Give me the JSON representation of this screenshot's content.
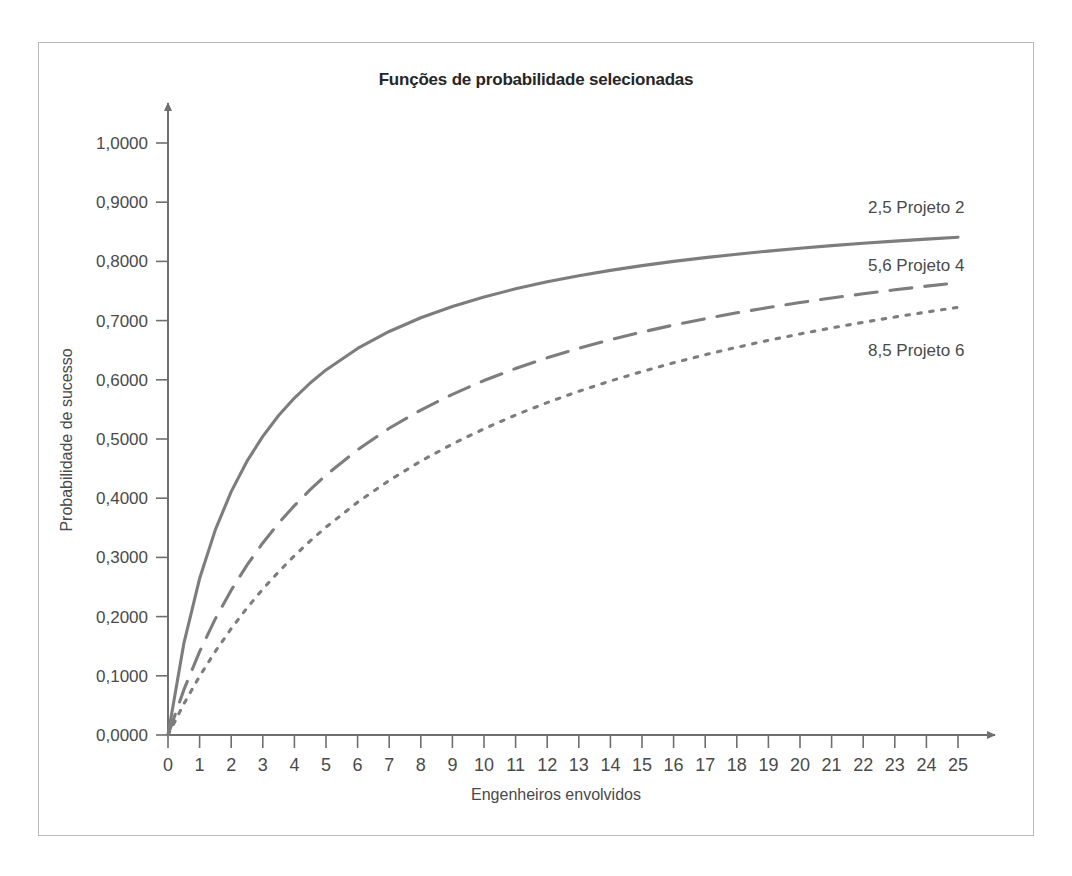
{
  "figure": {
    "title": "Funções de probabilidade selecionadas",
    "frame_color": "#b9b9b9",
    "background": "#ffffff"
  },
  "chart_data": {
    "type": "line",
    "title": "Funções de probabilidade selecionadas",
    "xlabel": "Engenheiros envolvidos",
    "ylabel": "Probabilidade de sucesso",
    "xlim": [
      0,
      25
    ],
    "ylim": [
      0,
      1.0
    ],
    "grid": false,
    "legend_position": "right-inline",
    "x_ticks": [
      0,
      1,
      2,
      3,
      4,
      5,
      6,
      7,
      8,
      9,
      10,
      11,
      12,
      13,
      14,
      15,
      16,
      17,
      18,
      19,
      20,
      21,
      22,
      23,
      24,
      25
    ],
    "x_tick_labels": [
      "0",
      "1",
      "2",
      "3",
      "4",
      "5",
      "6",
      "7",
      "8",
      "9",
      "10",
      "11",
      "12",
      "13",
      "14",
      "15",
      "16",
      "17",
      "18",
      "19",
      "20",
      "21",
      "22",
      "23",
      "24",
      "25"
    ],
    "y_ticks": [
      0.0,
      0.1,
      0.2,
      0.3,
      0.4,
      0.5,
      0.6,
      0.7,
      0.8,
      0.9,
      1.0
    ],
    "y_tick_labels": [
      "0,0000",
      "0,1000",
      "0,2000",
      "0,3000",
      "0,4000",
      "0,5000",
      "0,6000",
      "0,7000",
      "0,8000",
      "0,9000",
      "1,0000"
    ],
    "x": [
      0,
      0.5,
      1,
      1.5,
      2,
      2.5,
      3,
      3.5,
      4,
      4.5,
      5,
      6,
      7,
      8,
      9,
      10,
      11,
      12,
      13,
      14,
      15,
      16,
      17,
      18,
      19,
      20,
      21,
      22,
      23,
      24,
      25
    ],
    "series": [
      {
        "name": "2,5 Projeto 2",
        "legend_label": "2,5 Projeto 2",
        "param_k": 2.5,
        "asymptote": 0.925,
        "style": "solid",
        "color": "#7d7d7d",
        "values": [
          0.0,
          0.1542,
          0.2643,
          0.3469,
          0.4111,
          0.4625,
          0.5045,
          0.5396,
          0.5692,
          0.5946,
          0.6167,
          0.6529,
          0.6816,
          0.7048,
          0.7239,
          0.74,
          0.7537,
          0.7655,
          0.7758,
          0.7848,
          0.7929,
          0.8,
          0.8064,
          0.8122,
          0.8174,
          0.8222,
          0.8266,
          0.8306,
          0.8343,
          0.8377,
          0.8409
        ]
      },
      {
        "name": "5,6 Projeto 4",
        "legend_label": "5,6 Projeto 4",
        "param_k": 5.6,
        "asymptote": 0.93,
        "style": "dashed",
        "color": "#7d7d7d",
        "values": [
          0.0,
          0.0762,
          0.1409,
          0.1965,
          0.2447,
          0.287,
          0.3244,
          0.3577,
          0.3875,
          0.4144,
          0.4389,
          0.4819,
          0.5181,
          0.5489,
          0.5755,
          0.5987,
          0.6191,
          0.6371,
          0.6532,
          0.6677,
          0.6807,
          0.6925,
          0.7032,
          0.7131,
          0.7221,
          0.7305,
          0.7382,
          0.7453,
          0.752,
          0.7582,
          0.764
        ]
      },
      {
        "name": "8,5 Projeto 6",
        "legend_label": "8,5 Projeto 6",
        "param_k": 8.5,
        "asymptote": 0.944,
        "style": "dotted",
        "color": "#7d7d7d",
        "values": [
          0.0,
          0.0525,
          0.0993,
          0.1414,
          0.1797,
          0.2145,
          0.2464,
          0.2757,
          0.3027,
          0.3278,
          0.3511,
          0.3932,
          0.4301,
          0.4626,
          0.4915,
          0.5173,
          0.5405,
          0.5615,
          0.5806,
          0.598,
          0.614,
          0.6287,
          0.6423,
          0.6549,
          0.6666,
          0.6775,
          0.6876,
          0.6971,
          0.706,
          0.7144,
          0.7223
        ]
      }
    ]
  },
  "annotations": {
    "series_labels": [
      {
        "text": "2,5 Projeto 2",
        "x_px": 868,
        "y_px": 213
      },
      {
        "text": "5,6 Projeto 4",
        "x_px": 868,
        "y_px": 271
      },
      {
        "text": "8,5 Projeto 6",
        "x_px": 868,
        "y_px": 356
      }
    ]
  }
}
